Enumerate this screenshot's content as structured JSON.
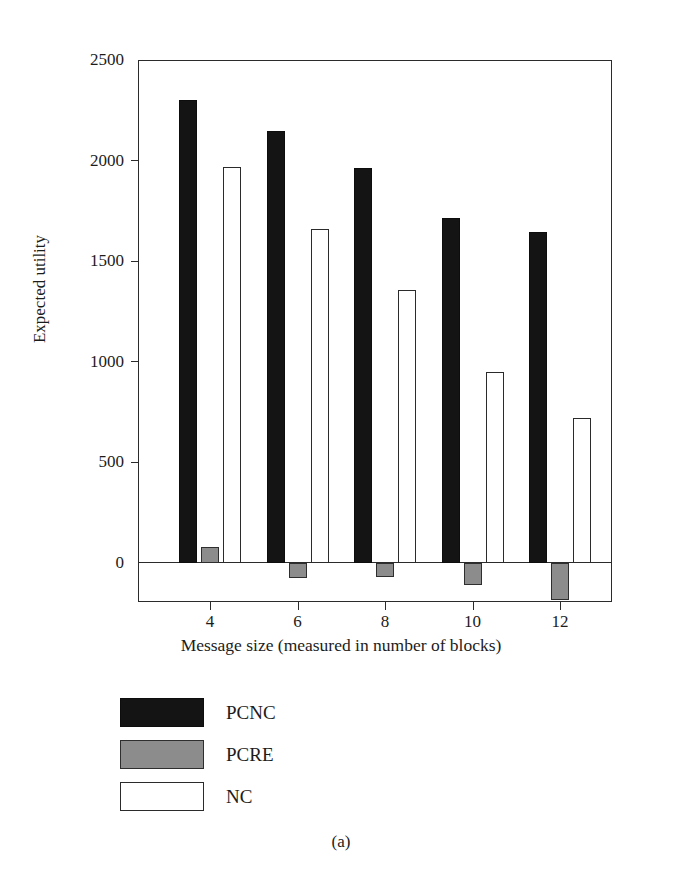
{
  "figure": {
    "caption": "(a)"
  },
  "chart_data": {
    "type": "bar",
    "title": "",
    "xlabel": "Message size (measured in number of blocks)",
    "ylabel": "Expected utility",
    "categories": [
      "4",
      "6",
      "8",
      "10",
      "12"
    ],
    "x": [
      4,
      6,
      8,
      10,
      12
    ],
    "series": [
      {
        "name": "PCNC",
        "color": "#141414",
        "values": [
          2300,
          2145,
          1965,
          1715,
          1645
        ]
      },
      {
        "name": "PCRE",
        "color": "#8c8c8c",
        "values": [
          80,
          -75,
          -70,
          -110,
          -185
        ]
      },
      {
        "name": "NC",
        "color": "#ffffff",
        "values": [
          1970,
          1660,
          1355,
          950,
          720
        ]
      }
    ],
    "ylim": [
      -195,
      2500
    ],
    "yticks": [
      0,
      500,
      1000,
      1500,
      2000,
      2500
    ],
    "ytick_labels": [
      "0",
      "500",
      "1000",
      "1500",
      "2000",
      "2500"
    ],
    "xticks": [
      4,
      6,
      8,
      10,
      12
    ],
    "xtick_labels": [
      "4",
      "6",
      "8",
      "10",
      "12"
    ],
    "grid": false,
    "legend_position": "below-plot",
    "legend": [
      "PCNC",
      "PCRE",
      "NC"
    ]
  }
}
